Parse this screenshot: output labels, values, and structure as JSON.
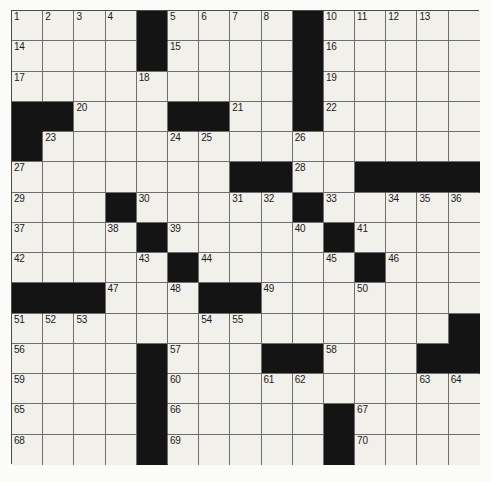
{
  "puzzle": {
    "title": "Crossword Puzzle Grid",
    "type": "crossword",
    "rows": 15,
    "columns": 15,
    "colors": {
      "cell_fill": "#f1f0eb",
      "block_fill": "#141414",
      "grid_line": "#6e6e6e",
      "border": "#4a4a4a",
      "page_background": "#fbfbf9",
      "number_text": "#1a1a1a"
    },
    "highest_number": 70,
    "block_count": 52,
    "blocks": [
      [
        0,
        4
      ],
      [
        0,
        9
      ],
      [
        1,
        4
      ],
      [
        1,
        9
      ],
      [
        2,
        9
      ],
      [
        3,
        0
      ],
      [
        3,
        1
      ],
      [
        3,
        5
      ],
      [
        3,
        6
      ],
      [
        3,
        9
      ],
      [
        4,
        0
      ],
      [
        5,
        7
      ],
      [
        5,
        8
      ],
      [
        5,
        11
      ],
      [
        5,
        12
      ],
      [
        5,
        13
      ],
      [
        5,
        14
      ],
      [
        6,
        3
      ],
      [
        6,
        9
      ],
      [
        7,
        4
      ],
      [
        7,
        10
      ],
      [
        8,
        5
      ],
      [
        8,
        11
      ],
      [
        9,
        0
      ],
      [
        9,
        1
      ],
      [
        9,
        2
      ],
      [
        9,
        6
      ],
      [
        9,
        7
      ],
      [
        10,
        14
      ],
      [
        11,
        4
      ],
      [
        11,
        8
      ],
      [
        11,
        9
      ],
      [
        11,
        13
      ],
      [
        11,
        14
      ],
      [
        12,
        4
      ],
      [
        13,
        4
      ],
      [
        13,
        10
      ],
      [
        14,
        4
      ],
      [
        14,
        10
      ]
    ],
    "numbers": [
      {
        "n": 1,
        "row": 0,
        "col": 0
      },
      {
        "n": 2,
        "row": 0,
        "col": 1
      },
      {
        "n": 3,
        "row": 0,
        "col": 2
      },
      {
        "n": 4,
        "row": 0,
        "col": 3
      },
      {
        "n": 5,
        "row": 0,
        "col": 5
      },
      {
        "n": 6,
        "row": 0,
        "col": 6
      },
      {
        "n": 7,
        "row": 0,
        "col": 7
      },
      {
        "n": 8,
        "row": 0,
        "col": 8
      },
      {
        "n": 9,
        "row": 0,
        "col": 9
      },
      {
        "n": 10,
        "row": 0,
        "col": 10
      },
      {
        "n": 11,
        "row": 0,
        "col": 11
      },
      {
        "n": 12,
        "row": 0,
        "col": 12
      },
      {
        "n": 13,
        "row": 0,
        "col": 13
      },
      {
        "n": 14,
        "row": 1,
        "col": 0
      },
      {
        "n": 15,
        "row": 1,
        "col": 5
      },
      {
        "n": 16,
        "row": 1,
        "col": 10
      },
      {
        "n": 17,
        "row": 2,
        "col": 0
      },
      {
        "n": 18,
        "row": 2,
        "col": 4
      },
      {
        "n": 19,
        "row": 2,
        "col": 10
      },
      {
        "n": 20,
        "row": 3,
        "col": 2
      },
      {
        "n": 21,
        "row": 3,
        "col": 7
      },
      {
        "n": 22,
        "row": 3,
        "col": 10
      },
      {
        "n": 23,
        "row": 4,
        "col": 1
      },
      {
        "n": 24,
        "row": 4,
        "col": 5
      },
      {
        "n": 25,
        "row": 4,
        "col": 6
      },
      {
        "n": 26,
        "row": 4,
        "col": 9
      },
      {
        "n": 27,
        "row": 5,
        "col": 0
      },
      {
        "n": 28,
        "row": 5,
        "col": 9
      },
      {
        "n": 29,
        "row": 6,
        "col": 0
      },
      {
        "n": 30,
        "row": 6,
        "col": 4
      },
      {
        "n": 31,
        "row": 6,
        "col": 7
      },
      {
        "n": 32,
        "row": 6,
        "col": 8
      },
      {
        "n": 33,
        "row": 6,
        "col": 10
      },
      {
        "n": 34,
        "row": 6,
        "col": 12
      },
      {
        "n": 35,
        "row": 6,
        "col": 13
      },
      {
        "n": 36,
        "row": 6,
        "col": 14
      },
      {
        "n": 37,
        "row": 7,
        "col": 0
      },
      {
        "n": 38,
        "row": 7,
        "col": 3
      },
      {
        "n": 39,
        "row": 7,
        "col": 5
      },
      {
        "n": 40,
        "row": 7,
        "col": 9
      },
      {
        "n": 41,
        "row": 7,
        "col": 11
      },
      {
        "n": 42,
        "row": 8,
        "col": 0
      },
      {
        "n": 43,
        "row": 8,
        "col": 4
      },
      {
        "n": 44,
        "row": 8,
        "col": 6
      },
      {
        "n": 45,
        "row": 8,
        "col": 10
      },
      {
        "n": 46,
        "row": 8,
        "col": 12
      },
      {
        "n": 47,
        "row": 9,
        "col": 3
      },
      {
        "n": 48,
        "row": 9,
        "col": 5
      },
      {
        "n": 49,
        "row": 9,
        "col": 8
      },
      {
        "n": 50,
        "row": 9,
        "col": 11
      },
      {
        "n": 51,
        "row": 10,
        "col": 0
      },
      {
        "n": 52,
        "row": 10,
        "col": 1
      },
      {
        "n": 53,
        "row": 10,
        "col": 2
      },
      {
        "n": 54,
        "row": 10,
        "col": 6
      },
      {
        "n": 55,
        "row": 10,
        "col": 7
      },
      {
        "n": 56,
        "row": 11,
        "col": 0
      },
      {
        "n": 57,
        "row": 11,
        "col": 5
      },
      {
        "n": 58,
        "row": 11,
        "col": 10
      },
      {
        "n": 59,
        "row": 12,
        "col": 0
      },
      {
        "n": 60,
        "row": 12,
        "col": 5
      },
      {
        "n": 61,
        "row": 12,
        "col": 8
      },
      {
        "n": 62,
        "row": 12,
        "col": 9
      },
      {
        "n": 63,
        "row": 12,
        "col": 13
      },
      {
        "n": 64,
        "row": 12,
        "col": 14
      },
      {
        "n": 65,
        "row": 13,
        "col": 0
      },
      {
        "n": 66,
        "row": 13,
        "col": 5
      },
      {
        "n": 67,
        "row": 13,
        "col": 11
      },
      {
        "n": 68,
        "row": 14,
        "col": 0
      },
      {
        "n": 69,
        "row": 14,
        "col": 5
      },
      {
        "n": 70,
        "row": 14,
        "col": 11
      }
    ],
    "entries": []
  }
}
